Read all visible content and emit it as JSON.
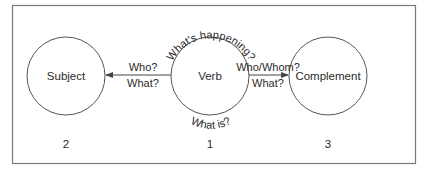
{
  "diagram": {
    "nodes": [
      {
        "id": "subject",
        "label": "Subject",
        "number": "2"
      },
      {
        "id": "verb",
        "label": "Verb",
        "number": "1"
      },
      {
        "id": "complement",
        "label": "Complement",
        "number": "3"
      }
    ],
    "edges": [
      {
        "from": "verb",
        "to": "subject",
        "line1": "Who?",
        "line2": "What?"
      },
      {
        "from": "verb",
        "to": "complement",
        "line1": "Who/Whom?",
        "line2": "What?"
      }
    ],
    "verb_top_label": "What's happening?",
    "verb_bottom_label": "What is?"
  },
  "colors": {
    "stroke": "#555555",
    "text": "#2a2a2a",
    "border": "#7a7a7a"
  }
}
